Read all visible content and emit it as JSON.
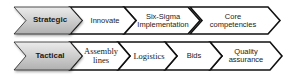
{
  "rows": [
    {
      "category": "Strategic",
      "items": [
        "Innovate",
        "Six-Sigma Implementation",
        "Core competencies"
      ]
    },
    {
      "category": "Tactical",
      "items": [
        "Assembly lines",
        "Logistics",
        "Bids",
        "Quality assurance"
      ]
    }
  ],
  "labels": {
    "strategic": "Strategic",
    "innovate": "Innovate",
    "six_sigma_1": "Six-Sigma",
    "six_sigma_2": "Implementation",
    "core_1": "Core",
    "core_2": "competencies",
    "tactical": "Tactical",
    "assembly_1": "Assembly",
    "assembly_2": "lines",
    "logistics": "Logistics",
    "bids": "Bids",
    "quality_1": "Quality",
    "quality_2": "assurance"
  },
  "colors": {
    "header_fill_top": "#e6e6e6",
    "header_fill_bottom": "#b5b5b5",
    "item_fill": "#ffffff",
    "stroke": "#111111"
  }
}
